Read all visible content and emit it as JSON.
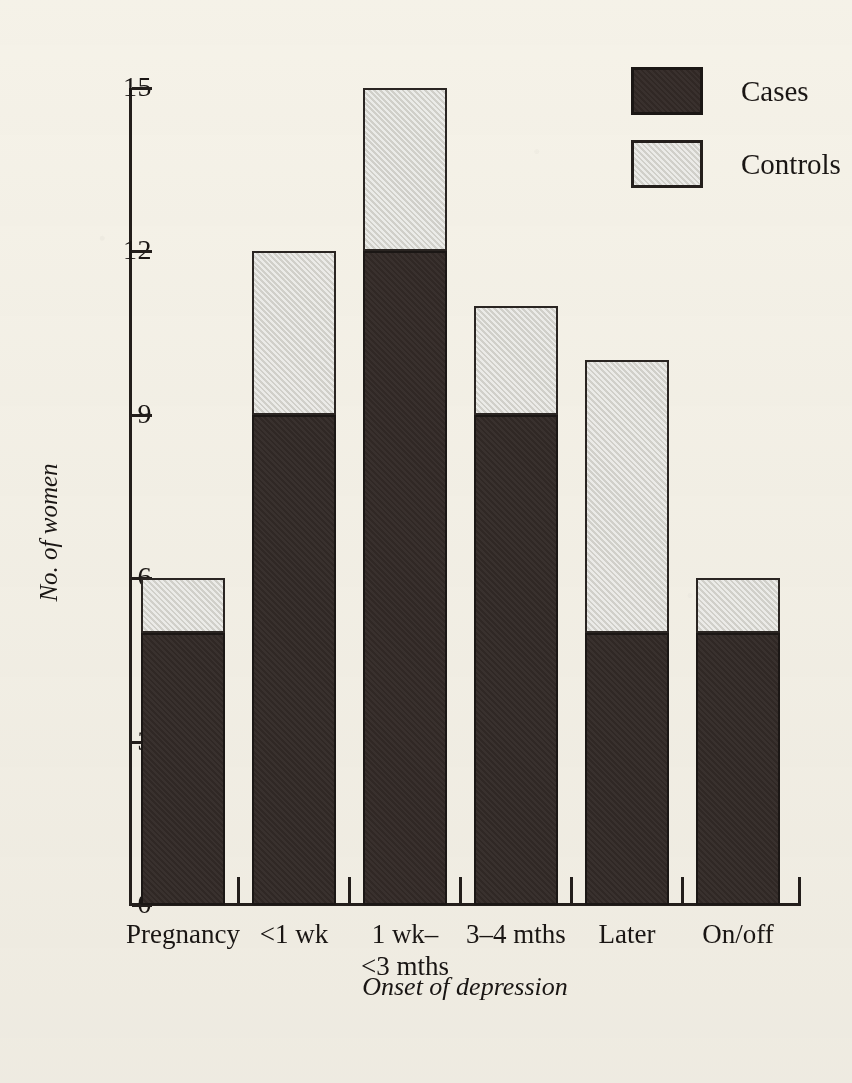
{
  "chart_data": {
    "type": "bar",
    "variant": "stacked",
    "title": "",
    "xlabel": "Onset of depression",
    "ylabel": "No. of women",
    "categories": [
      "Pregnancy",
      "<1 wk",
      "1 wk–\n<3 mths",
      "3–4 mths",
      "Later",
      "On/off"
    ],
    "series": [
      {
        "name": "Cases",
        "values": [
          5,
          9,
          12,
          9,
          5,
          5
        ],
        "color": "#322926"
      },
      {
        "name": "Controls",
        "values": [
          1,
          3,
          3,
          2,
          5,
          1
        ],
        "color": "#d7d6d0"
      }
    ],
    "totals": [
      6,
      12,
      15,
      11,
      10,
      6
    ],
    "ylim": [
      0,
      15
    ],
    "yticks": [
      0,
      3,
      6,
      9,
      12,
      15
    ],
    "ytick_labels": [
      "0",
      "3",
      "6",
      "9",
      "12",
      "15"
    ],
    "grid": false,
    "legend_position": "top-right",
    "legend_entries": [
      "Cases",
      "Controls"
    ]
  },
  "legend": {
    "items": [
      {
        "label": "Cases",
        "swatch": "dark-filled-square"
      },
      {
        "label": "Controls",
        "swatch": "light-gray-square"
      }
    ]
  },
  "axes": {
    "y_title": "No. of women",
    "x_title": "Onset of depression",
    "y_labels": [
      "15",
      "12",
      "9",
      "6",
      "3",
      "0"
    ],
    "x_labels": [
      "Pregnancy",
      "<1 wk",
      "1 wk–\n<3 mths",
      "3–4 mths",
      "Later",
      "On/off"
    ]
  },
  "colors": {
    "background": "#f5f3ed",
    "ink": "#231e1b",
    "cases": "#322926",
    "controls": "#d7d6d0"
  }
}
